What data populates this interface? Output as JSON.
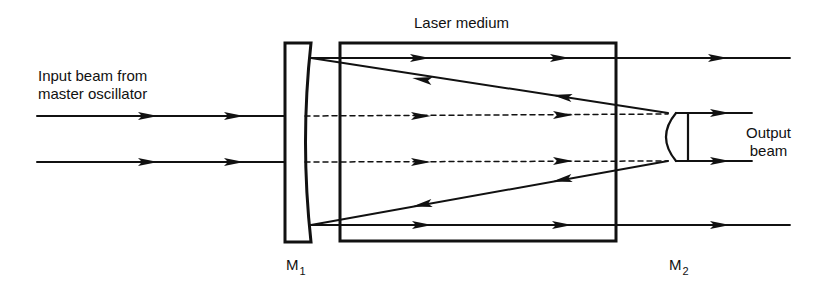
{
  "diagram": {
    "type": "unstable-resonator-amplifier",
    "labels": {
      "input_line1": "Input beam from",
      "input_line2": "master oscillator",
      "medium": "Laser medium",
      "output_line1": "Output",
      "output_line2": "beam",
      "m1_main": "M",
      "m1_sub": "1",
      "m2_main": "M",
      "m2_sub": "2"
    },
    "components": [
      {
        "id": "M1",
        "kind": "concave-mirror"
      },
      {
        "id": "laser-medium",
        "kind": "gain-medium-box"
      },
      {
        "id": "M2",
        "kind": "convex-mirror"
      }
    ],
    "colors": {
      "ink": "#111111",
      "background": "#ffffff"
    }
  }
}
